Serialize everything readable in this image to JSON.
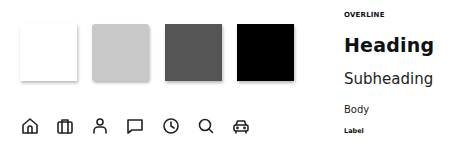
{
  "swatches": [
    {
      "name": "white",
      "color": "#ffffff"
    },
    {
      "name": "light-gray",
      "color": "#c8c8c8"
    },
    {
      "name": "dark-gray",
      "color": "#555555"
    },
    {
      "name": "black",
      "color": "#000000"
    }
  ],
  "icons": [
    "home-icon",
    "briefcase-icon",
    "user-icon",
    "chat-icon",
    "clock-icon",
    "search-icon",
    "car-icon"
  ],
  "typography": {
    "overline": "OVERLINE",
    "heading": "Heading",
    "subheading": "Subheading",
    "body": "Body",
    "label": "Label"
  }
}
